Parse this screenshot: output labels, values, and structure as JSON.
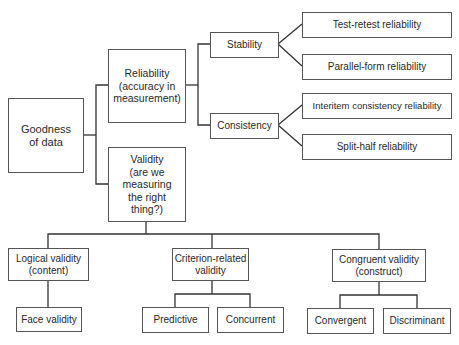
{
  "diagram": {
    "type": "tree",
    "root": {
      "id": "goodness",
      "label": "Goodness\nof data",
      "children": [
        {
          "id": "reliability",
          "label": "Reliability\n(accuracy in\nmeasurement)",
          "children": [
            {
              "id": "stability",
              "label": "Stability",
              "children": [
                {
                  "id": "test_retest",
                  "label": "Test-retest reliability"
                },
                {
                  "id": "parallel_form",
                  "label": "Parallel-form reliability"
                }
              ]
            },
            {
              "id": "consistency",
              "label": "Consistency",
              "children": [
                {
                  "id": "interitem",
                  "label": "Interitem consistency reliability"
                },
                {
                  "id": "split_half",
                  "label": "Split-half reliability"
                }
              ]
            }
          ]
        },
        {
          "id": "validity",
          "label": "Validity\n(are we\nmeasuring\nthe right\nthing?)",
          "children": [
            {
              "id": "logical",
              "label": "Logical validity\n(content)",
              "children": [
                {
                  "id": "face",
                  "label": "Face validity"
                }
              ]
            },
            {
              "id": "criterion",
              "label": "Criterion-related\nvalidity",
              "children": [
                {
                  "id": "predictive",
                  "label": "Predictive"
                },
                {
                  "id": "concurrent",
                  "label": "Concurrent"
                }
              ]
            },
            {
              "id": "congruent",
              "label": "Congruent validity\n(construct)",
              "children": [
                {
                  "id": "convergent",
                  "label": "Convergent"
                },
                {
                  "id": "discriminant",
                  "label": "Discriminant"
                }
              ]
            }
          ]
        }
      ]
    }
  },
  "labels": {
    "goodness": "Goodness\nof data",
    "reliability": "Reliability\n(accuracy in\nmeasurement)",
    "validity": "Validity\n(are we\nmeasuring\nthe right\nthing?)",
    "stability": "Stability",
    "consistency": "Consistency",
    "test_retest": "Test-retest reliability",
    "parallel_form": "Parallel-form reliability",
    "interitem": "Interitem consistency reliability",
    "split_half": "Split-half reliability",
    "logical": "Logical validity\n(content)",
    "criterion": "Criterion-related\nvalidity",
    "congruent": "Congruent validity\n(construct)",
    "face": "Face validity",
    "predictive": "Predictive",
    "concurrent": "Concurrent",
    "convergent": "Convergent",
    "discriminant": "Discriminant"
  },
  "colors": {
    "line": "#333333",
    "border": "#555555",
    "text": "#2a2a2a",
    "background": "#ffffff"
  }
}
